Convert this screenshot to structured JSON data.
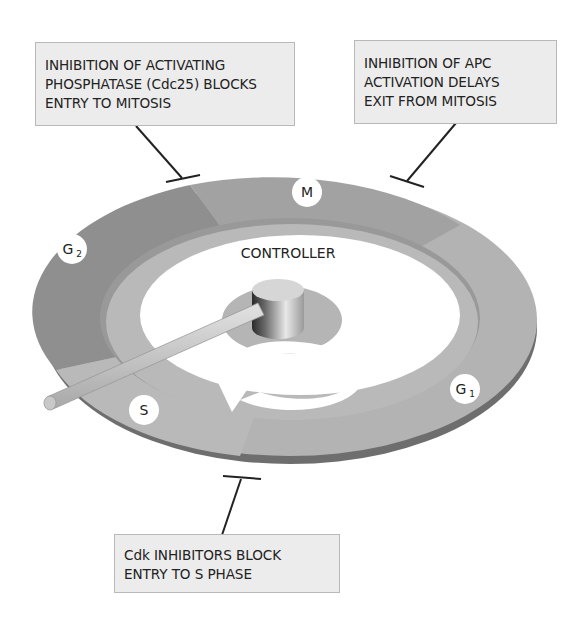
{
  "diagram": {
    "controller_label": "CONTROLLER",
    "phases": [
      {
        "id": "M",
        "label": "M",
        "sub": ""
      },
      {
        "id": "G2",
        "label": "G",
        "sub": "2"
      },
      {
        "id": "S",
        "label": "S",
        "sub": ""
      },
      {
        "id": "G1",
        "label": "G",
        "sub": "1"
      }
    ],
    "inhibitions": [
      {
        "id": "cdc25",
        "lines": [
          "INHIBITION OF ACTIVATING",
          "PHOSPHATASE (Cdc25) BLOCKS",
          "ENTRY TO MITOSIS"
        ],
        "target": "G2/M transition"
      },
      {
        "id": "apc",
        "lines": [
          "INHIBITION OF APC",
          "ACTIVATION DELAYS",
          "EXIT FROM MITOSIS"
        ],
        "target": "M exit"
      },
      {
        "id": "cdk-inhibitors",
        "lines": [
          "Cdk INHIBITORS BLOCK",
          "ENTRY TO S PHASE"
        ],
        "target": "G1/S transition"
      }
    ],
    "colors": {
      "ring_light": "#b5b5b5",
      "ring_medium": "#a3a3a3",
      "ring_dark": "#8c8c8c",
      "ring_edge": "#6e6e6e",
      "inner_track": "#b8b8b8",
      "box_fill": "#ececec",
      "box_border": "#b9b9b9",
      "text": "#222222"
    }
  }
}
